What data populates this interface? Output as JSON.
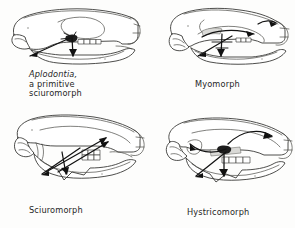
{
  "figure": {
    "background_color": "#fdfdfc",
    "ink_color": "#3a3a38",
    "arrow_color": "#111111",
    "panel_count": 4
  },
  "panels": [
    {
      "id": "aplodontia",
      "position": "top-left",
      "caption_lines": [
        "Aplodontia,",
        "a primitive",
        "sciuromorph"
      ],
      "caption_italic_first_line": true,
      "arrows": 2,
      "arrow_description": "two muscle vectors radiating forward-down and downward from the orbital region",
      "tooth_row": "cheek tooth row shown as small boxes along the maxilla"
    },
    {
      "id": "myomorph",
      "position": "top-right",
      "caption_lines": [
        "Myomorph"
      ],
      "caption_italic_first_line": false,
      "arrows": 4,
      "arrow_description": "curved vector over the zygomatic plate plus crossing vectors to the lower jaw",
      "tooth_row": "short cheek tooth row"
    },
    {
      "id": "sciuromorph",
      "position": "bottom-left",
      "caption_lines": [
        "Sciuromorph"
      ],
      "caption_italic_first_line": false,
      "arrows": 4,
      "arrow_description": "long crossing vectors from the anterior zygomatic plate to the mandible",
      "tooth_row": "cheek tooth row drawn as a grid of small squares"
    },
    {
      "id": "hystricomorph",
      "position": "bottom-right",
      "caption_lines": [
        "Hystricomorph"
      ],
      "caption_italic_first_line": false,
      "arrows": 4,
      "arrow_description": "vector through the enlarged infraorbital foramen plus two descending vectors",
      "tooth_row": "cheek tooth row drawn as a row of boxes"
    }
  ],
  "captions": {
    "aplodontia_line1": "Aplodontia,",
    "aplodontia_line2": "a primitive",
    "aplodontia_line3": "sciuromorph",
    "myomorph": "Myomorph",
    "sciuromorph": "Sciuromorph",
    "hystricomorph": "Hystricomorph"
  }
}
